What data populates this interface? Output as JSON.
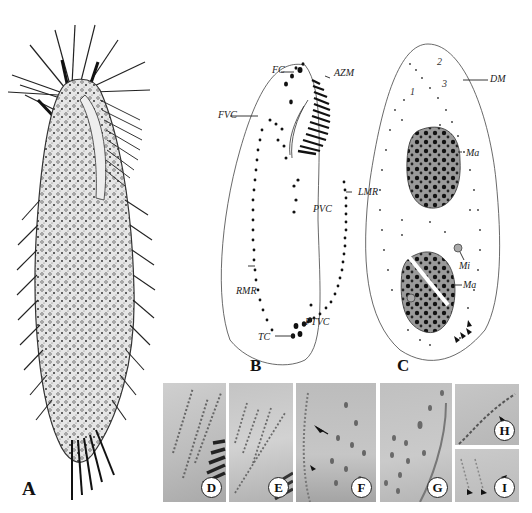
{
  "figure": {
    "panels": {
      "A": {
        "label": "A",
        "kind": "drawing",
        "description": "live ciliate drawing, ventral view"
      },
      "B": {
        "label": "B",
        "kind": "diagram",
        "description": "ventral infraciliature"
      },
      "C": {
        "label": "C",
        "kind": "diagram",
        "description": "dorsal infraciliature and nuclear apparatus"
      },
      "D": {
        "label": "D",
        "kind": "photo"
      },
      "E": {
        "label": "E",
        "kind": "photo"
      },
      "F": {
        "label": "F",
        "kind": "photo"
      },
      "G": {
        "label": "G",
        "kind": "photo"
      },
      "H": {
        "label": "H",
        "kind": "photo"
      },
      "I": {
        "label": "I",
        "kind": "photo"
      }
    },
    "B_labels": {
      "fc": "FC",
      "azm": "AZM",
      "fvc": "FVC",
      "lmr": "LMR",
      "pvc": "PVC",
      "rmr": "RMR",
      "ptvc": "PTVC",
      "tc": "TC"
    },
    "C_labels": {
      "dm": "DM",
      "ma1": "Ma",
      "mi": "Mi",
      "ma2": "Ma",
      "kinety_1": "1",
      "kinety_2": "2",
      "kinety_3": "3"
    }
  }
}
